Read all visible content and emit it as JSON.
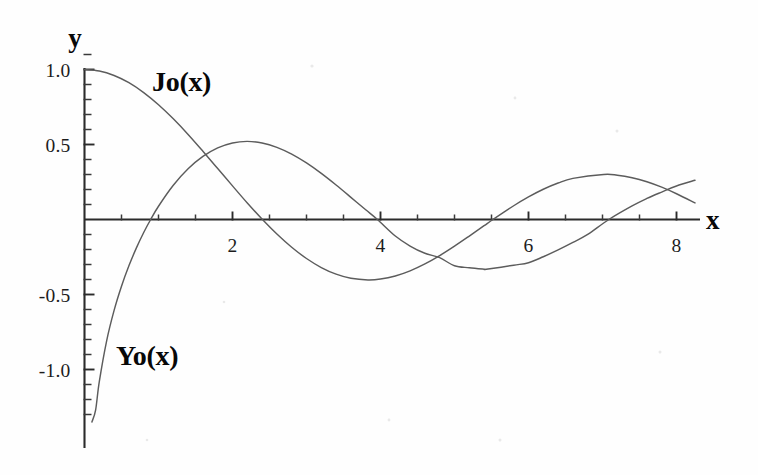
{
  "chart_data": {
    "type": "line",
    "title": "",
    "subtitle": "",
    "xlabel": "x",
    "ylabel": "y",
    "xlim": [
      0,
      8.25
    ],
    "ylim": [
      -1.35,
      1.12
    ],
    "grid": false,
    "legend_position": "inline-annotation",
    "x_ticks_major": [
      2,
      4,
      6,
      8
    ],
    "x_ticks_major_labels": [
      "2",
      "4",
      "6",
      "8"
    ],
    "x_tick_minor_step": 0.5,
    "y_ticks_major": [
      1.0,
      0.5,
      -0.5,
      -1.0
    ],
    "y_ticks_major_labels": [
      "1.0",
      "0.5",
      "-0.5",
      "-1.0"
    ],
    "y_tick_minor_step": 0.1,
    "annotations": [
      {
        "text": "Jo(x)",
        "x": 1.6,
        "y": 0.91
      },
      {
        "text": "Yo(x)",
        "x": 0.72,
        "y": -0.83
      }
    ],
    "series": [
      {
        "name": "Jo(x)",
        "label": "Jo(x)",
        "color": "#5c5c5c",
        "zeros": [
          2.405,
          5.52,
          8.654
        ],
        "x": [
          0,
          0.2,
          0.4,
          0.6,
          0.8,
          1.0,
          1.2,
          1.4,
          1.6,
          1.8,
          2.0,
          2.2,
          2.405,
          2.6,
          2.8,
          3.0,
          3.2,
          3.4,
          3.6,
          3.831,
          4.0,
          4.2,
          4.4,
          4.6,
          4.8,
          5.0,
          5.2,
          5.4,
          5.52,
          5.8,
          6.0,
          6.2,
          6.4,
          6.6,
          7.016,
          7.2,
          7.4,
          7.6,
          7.8,
          8.0,
          8.25
        ],
        "values": [
          1.0,
          0.99,
          0.96,
          0.912,
          0.846,
          0.765,
          0.671,
          0.567,
          0.455,
          0.34,
          0.224,
          0.11,
          0.0,
          -0.0968,
          -0.185,
          -0.2601,
          -0.3202,
          -0.3643,
          -0.3918,
          -0.4028,
          -0.3971,
          -0.3766,
          -0.3423,
          -0.2961,
          -0.2404,
          -0.1776,
          -0.1103,
          -0.0412,
          0.0,
          0.0917,
          0.1506,
          0.2017,
          0.2433,
          0.274,
          0.3001,
          0.2951,
          0.2786,
          0.2516,
          0.2154,
          0.1717,
          0.1107
        ]
      },
      {
        "name": "Yo(x)",
        "label": "Yo(x)",
        "color": "#5c5c5c",
        "zeros": [
          0.894,
          3.958,
          7.086
        ],
        "x": [
          0.1,
          0.15,
          0.2,
          0.3,
          0.4,
          0.5,
          0.6,
          0.7,
          0.8,
          0.894,
          1.0,
          1.2,
          1.4,
          1.6,
          1.8,
          2.0,
          2.197,
          2.4,
          2.6,
          2.8,
          3.0,
          3.2,
          3.4,
          3.6,
          3.8,
          3.958,
          4.2,
          4.4,
          4.6,
          4.8,
          5.0,
          5.2,
          5.4,
          5.429,
          5.8,
          6.0,
          6.2,
          6.4,
          6.6,
          6.8,
          7.086,
          7.4,
          7.6,
          7.8,
          8.0,
          8.25
        ],
        "values": [
          -1.534,
          -1.271,
          -1.081,
          -0.807,
          -0.606,
          -0.445,
          -0.309,
          -0.191,
          -0.0868,
          0.0,
          0.0883,
          0.2281,
          0.3379,
          0.4204,
          0.4774,
          0.5104,
          0.5208,
          0.5104,
          0.4813,
          0.4359,
          0.3769,
          0.3071,
          0.2296,
          0.1477,
          0.0645,
          0.0,
          -0.1103,
          -0.1768,
          -0.2252,
          -0.2547,
          -0.3085,
          -0.3216,
          -0.3313,
          -0.3322,
          -0.3048,
          -0.2882,
          -0.2483,
          -0.2028,
          -0.1528,
          -0.0997,
          0.0,
          0.0905,
          0.1403,
          0.183,
          0.2235,
          0.2615
        ]
      }
    ]
  },
  "figure": {
    "background_color": "#fefefe",
    "axis_color": "#2b2b2b",
    "curve_color": "#5c5c5c",
    "label_color": "#080808"
  }
}
